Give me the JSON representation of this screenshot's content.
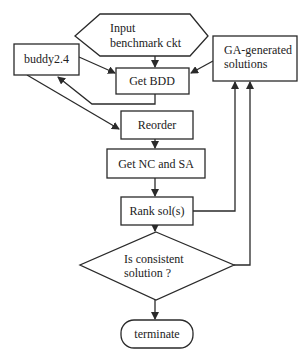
{
  "diagram": {
    "type": "flowchart",
    "colors": {
      "stroke": "#2a2a2a",
      "fill": "#ffffff",
      "text": "#222222"
    },
    "nodes": {
      "input": {
        "shape": "hexagon",
        "line1": "Input",
        "line2": "benchmark ckt"
      },
      "buddy": {
        "shape": "rect",
        "label": "buddy2.4"
      },
      "ga": {
        "shape": "rect",
        "line1": "GA-generated",
        "line2": "solutions"
      },
      "get_bdd": {
        "shape": "rect",
        "label": "Get BDD"
      },
      "reorder": {
        "shape": "rect",
        "label": "Reorder"
      },
      "get_nc_sa": {
        "shape": "rect",
        "label": "Get NC and SA"
      },
      "rank": {
        "shape": "rect",
        "label": "Rank sol(s)"
      },
      "decision": {
        "shape": "diamond",
        "line1": "Is consistent",
        "line2": "solution ?"
      },
      "terminate": {
        "shape": "rounded-rect",
        "label": "terminate"
      }
    },
    "edges": [
      {
        "from": "input",
        "to": "get_bdd"
      },
      {
        "from": "buddy",
        "to": "get_bdd"
      },
      {
        "from": "ga",
        "to": "get_bdd"
      },
      {
        "from": "get_bdd",
        "to": "buddy"
      },
      {
        "from": "buddy",
        "to": "reorder"
      },
      {
        "from": "reorder",
        "to": "get_nc_sa"
      },
      {
        "from": "get_nc_sa",
        "to": "rank"
      },
      {
        "from": "rank",
        "to": "ga"
      },
      {
        "from": "rank",
        "to": "decision"
      },
      {
        "from": "decision",
        "to": "ga"
      },
      {
        "from": "decision",
        "to": "terminate"
      }
    ]
  }
}
